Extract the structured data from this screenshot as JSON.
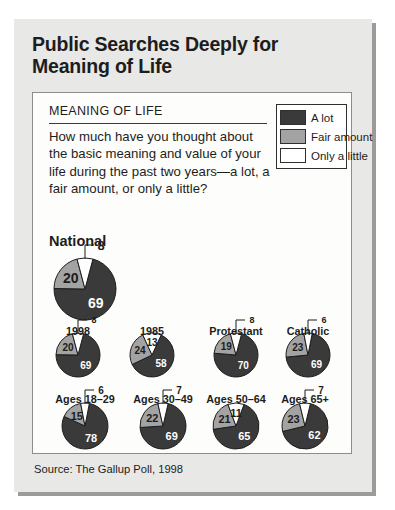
{
  "page": {
    "title": "Public Searches Deeply for Meaning of Life",
    "source": "Source: The Gallup Poll, 1998"
  },
  "question": {
    "heading": "MEANING OF LIFE",
    "text": "How much have you thought about the basic meaning and value of your life during the past two years—a lot, a fair amount, or only a little?"
  },
  "legend": {
    "items": [
      {
        "label": "A lot",
        "color": "#3a3a3a"
      },
      {
        "label": "Fair amount",
        "color": "#a3a3a3"
      },
      {
        "label": "Only a little",
        "color": "#ffffff"
      }
    ]
  },
  "national_heading": "National",
  "chart_data": {
    "type": "pie",
    "title": "Public Searches Deeply for Meaning of Life",
    "subtitle": "MEANING OF LIFE",
    "question": "How much have you thought about the basic meaning and value of your life during the past two years—a lot, a fair amount, or only a little?",
    "categories": [
      "A lot",
      "Fair amount",
      "Only a little"
    ],
    "colors": [
      "#3a3a3a",
      "#a3a3a3",
      "#ffffff"
    ],
    "units": "percent",
    "legend_position": "top-right",
    "source": "Source: The Gallup Poll, 1998",
    "pies": [
      {
        "name": "National",
        "row": 0,
        "values": [
          69,
          20,
          8
        ],
        "labels": [
          "69",
          "20",
          "8"
        ]
      },
      {
        "name": "1998",
        "row": 1,
        "values": [
          69,
          20,
          8
        ],
        "labels": [
          "69",
          "20",
          "8"
        ]
      },
      {
        "name": "1985",
        "row": 1,
        "values": [
          58,
          24,
          13
        ],
        "labels": [
          "58",
          "24",
          "13"
        ]
      },
      {
        "name": "Protestant",
        "row": 1,
        "values": [
          70,
          19,
          8
        ],
        "labels": [
          "70",
          "19",
          "8"
        ]
      },
      {
        "name": "Catholic",
        "row": 1,
        "values": [
          69,
          23,
          6
        ],
        "labels": [
          "69",
          "23",
          "6"
        ]
      },
      {
        "name": "Ages 18–29",
        "row": 2,
        "values": [
          78,
          15,
          6
        ],
        "labels": [
          "78",
          "15",
          "6"
        ]
      },
      {
        "name": "Ages 30–49",
        "row": 2,
        "values": [
          69,
          22,
          7
        ],
        "labels": [
          "69",
          "22",
          "7"
        ]
      },
      {
        "name": "Ages 50–64",
        "row": 2,
        "values": [
          65,
          21,
          11
        ],
        "labels": [
          "65",
          "21",
          "11"
        ]
      },
      {
        "name": "Ages 65+",
        "row": 2,
        "values": [
          62,
          23,
          7
        ],
        "labels": [
          "62",
          "23",
          "7"
        ]
      }
    ]
  }
}
